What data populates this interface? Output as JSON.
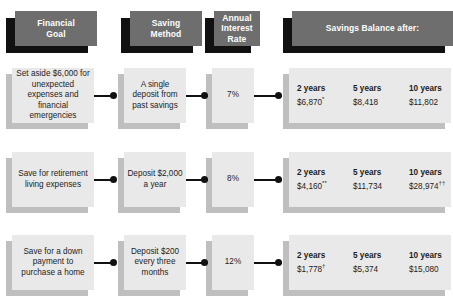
{
  "headers": [
    {
      "label": "Financial\nGoal",
      "name": "header-financial-goal"
    },
    {
      "label": "Saving\nMethod",
      "name": "header-saving-method"
    },
    {
      "label": "Annual\nInterest\nRate",
      "name": "header-annual-interest-rate"
    },
    {
      "label": "Savings Balance after:",
      "name": "header-savings-balance-after"
    }
  ],
  "balance_columns": [
    "2 years",
    "5 years",
    "10 years"
  ],
  "rows": [
    {
      "goal": "Set aside $6,000 for unexpected expenses and financial emergencies",
      "method": "A single deposit from past savings",
      "rate": "7%",
      "balances": [
        "$6,870",
        "$8,418",
        "$11,802"
      ],
      "balance_marks": [
        "*",
        "",
        ""
      ]
    },
    {
      "goal": "Save for retirement living expenses",
      "method": "Deposit $2,000 a year",
      "rate": "8%",
      "balances": [
        "$4,160",
        "$11,734",
        "$28,974"
      ],
      "balance_marks": [
        "**",
        "",
        "††"
      ]
    },
    {
      "goal": "Save for a down payment to purchase a home",
      "method": "Deposit $200 every three months",
      "rate": "12%",
      "balances": [
        "$1,778",
        "$5,374",
        "$15,080"
      ],
      "balance_marks": [
        "†",
        "",
        ""
      ]
    }
  ],
  "colors": {
    "header_fill": "#6e6e6e",
    "header_shadow": "#111111",
    "header_text": "#ffffff",
    "cell_fill": "#e9e9e9",
    "cell_shadow": "#bfbfbf",
    "connector": "#111111",
    "background": "#ffffff"
  }
}
